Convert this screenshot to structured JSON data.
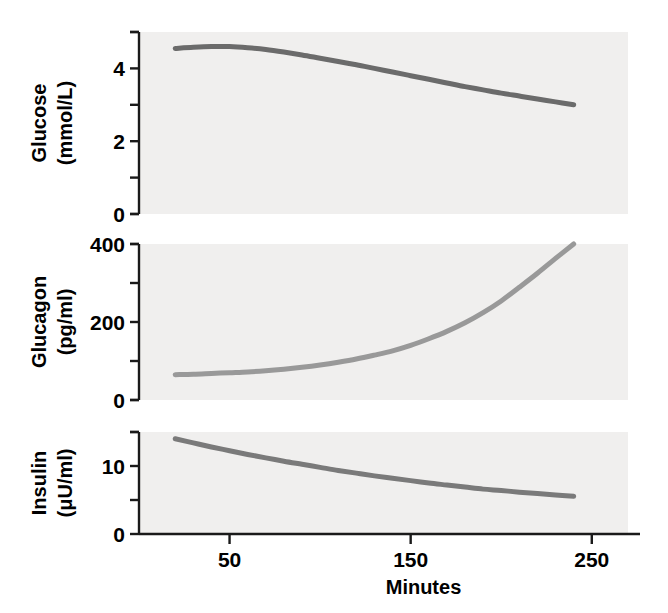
{
  "figure": {
    "background_color": "#ffffff",
    "panel_background_color": "#f0efee",
    "axis_color": "#1a1a1a",
    "x_axis_title": "Minutes"
  },
  "chart_data": [
    {
      "type": "line",
      "panel": "glucose",
      "title": "",
      "xlabel": "Minutes",
      "ylabel": "Glucose (mmol/L)",
      "ylabel_lines": [
        "Glucose",
        "(mmol/L)"
      ],
      "series_color": "#6b6b6b",
      "line_width": 5,
      "xlim": [
        0,
        270
      ],
      "ylim": [
        0,
        5
      ],
      "x_ticks": [
        50,
        150,
        250
      ],
      "x_tick_labels": [
        "50",
        "150",
        "250"
      ],
      "y_ticks": [
        0,
        1,
        2,
        3,
        4,
        5
      ],
      "y_tick_labels": [
        "0",
        "",
        "2",
        "",
        "4",
        ""
      ],
      "grid": false,
      "legend": "none",
      "x": [
        20,
        30,
        40,
        50,
        60,
        70,
        80,
        90,
        100,
        110,
        120,
        130,
        140,
        150,
        160,
        170,
        180,
        190,
        200,
        210,
        220,
        230,
        240
      ],
      "values": [
        4.55,
        4.58,
        4.6,
        4.6,
        4.57,
        4.52,
        4.45,
        4.37,
        4.28,
        4.19,
        4.1,
        4.0,
        3.9,
        3.8,
        3.7,
        3.6,
        3.5,
        3.41,
        3.32,
        3.24,
        3.16,
        3.08,
        3.0
      ]
    },
    {
      "type": "line",
      "panel": "glucagon",
      "title": "",
      "xlabel": "Minutes",
      "ylabel": "Glucagon (pg/ml)",
      "ylabel_lines": [
        "Glucagon",
        "(pg/ml)"
      ],
      "series_color": "#999999",
      "line_width": 5,
      "xlim": [
        0,
        270
      ],
      "ylim": [
        0,
        400
      ],
      "x_ticks": [
        50,
        150,
        250
      ],
      "x_tick_labels": [
        "50",
        "150",
        "250"
      ],
      "y_ticks": [
        0,
        100,
        200,
        300,
        400
      ],
      "y_tick_labels": [
        "0",
        "",
        "200",
        "",
        "400"
      ],
      "grid": false,
      "legend": "none",
      "x": [
        20,
        30,
        40,
        50,
        60,
        70,
        80,
        90,
        100,
        110,
        120,
        130,
        140,
        150,
        160,
        170,
        180,
        190,
        200,
        210,
        220,
        230,
        240
      ],
      "values": [
        65,
        66,
        68,
        70,
        72,
        75,
        79,
        84,
        90,
        97,
        105,
        115,
        126,
        140,
        157,
        176,
        198,
        224,
        254,
        289,
        325,
        363,
        400
      ]
    },
    {
      "type": "line",
      "panel": "insulin",
      "title": "",
      "xlabel": "Minutes",
      "ylabel": "Insulin (μU/ml)",
      "ylabel_lines": [
        "Insulin",
        "(μU/ml)"
      ],
      "series_color": "#7a7a7a",
      "line_width": 5,
      "xlim": [
        0,
        270
      ],
      "ylim": [
        0,
        15
      ],
      "x_ticks": [
        50,
        150,
        250
      ],
      "x_tick_labels": [
        "50",
        "150",
        "250"
      ],
      "y_ticks": [
        0,
        5,
        10,
        15
      ],
      "y_tick_labels": [
        "0",
        "",
        "10",
        ""
      ],
      "grid": false,
      "legend": "none",
      "x": [
        20,
        30,
        40,
        50,
        60,
        70,
        80,
        90,
        100,
        110,
        120,
        130,
        140,
        150,
        160,
        170,
        180,
        190,
        200,
        210,
        220,
        230,
        240
      ],
      "values": [
        14.0,
        13.4,
        12.8,
        12.25,
        11.7,
        11.2,
        10.7,
        10.25,
        9.8,
        9.35,
        8.95,
        8.55,
        8.2,
        7.85,
        7.5,
        7.2,
        6.9,
        6.6,
        6.4,
        6.15,
        5.95,
        5.75,
        5.55
      ]
    }
  ]
}
